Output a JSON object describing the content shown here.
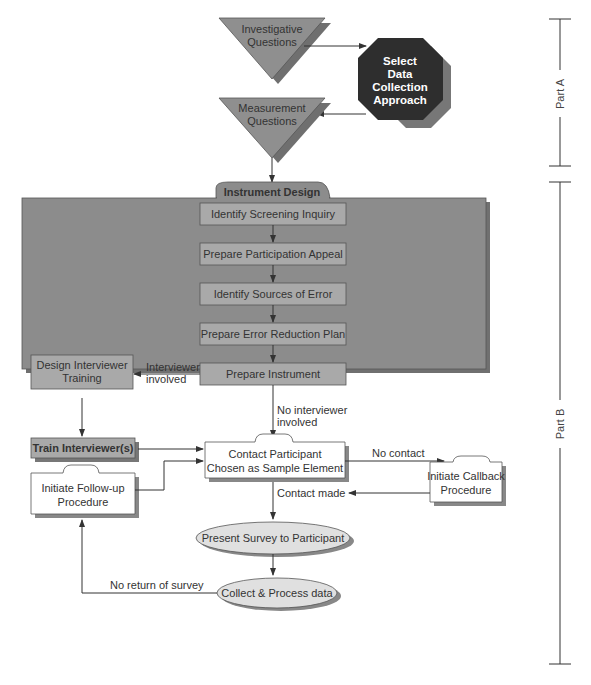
{
  "diagram": {
    "colors": {
      "panel": "#8c8c8c",
      "panel_shadow": "#6e6e6e",
      "step_box": "#a9a9a9",
      "triangle": "#8f8f8f",
      "octagon": "#2e2e2e",
      "ellipse": "#e0e0e0",
      "line": "#333333"
    },
    "part_a": {
      "label": "Part A",
      "investigative": [
        "Investigative",
        "Questions"
      ],
      "select_approach": [
        "Select",
        "Data",
        "Collection",
        "Approach"
      ],
      "measurement": [
        "Measurement",
        "Questions"
      ]
    },
    "part_b": {
      "label": "Part B",
      "instrument_design": {
        "title": "Instrument Design",
        "steps": [
          "Identify Screening Inquiry",
          "Prepare Participation Appeal",
          "Identify Sources of Error",
          "Prepare Error Reduction Plan",
          "Prepare Instrument"
        ]
      },
      "design_training": [
        "Design Interviewer",
        "Training"
      ],
      "interviewer_involved": [
        "Interviewer",
        "involved"
      ],
      "no_interviewer": [
        "No interviewer",
        "involved"
      ],
      "train_interviewers": "Train Interviewer(s)",
      "contact_participant": [
        "Contact Participant",
        "Chosen as Sample Element"
      ],
      "no_contact": "No contact",
      "callback": [
        "Initiate Callback",
        "Procedure"
      ],
      "contact_made": "Contact made",
      "follow_up": [
        "Initiate Follow-up",
        "Procedure"
      ],
      "present_survey": "Present Survey to Participant",
      "collect_process": "Collect & Process data",
      "no_return": "No return of survey"
    }
  }
}
